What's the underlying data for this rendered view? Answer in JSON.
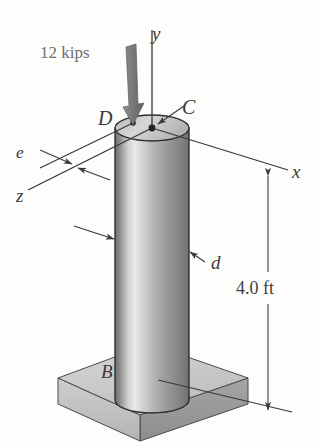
{
  "figure": {
    "kind": "engineering-diagram",
    "background_color": "#fdfdfc",
    "ink_color": "#3a3a3a"
  },
  "labels": {
    "load": "12 kips",
    "axis_y": "y",
    "axis_x": "x",
    "axis_z": "z",
    "eccentricity": "e",
    "diameter": "d",
    "point_c": "C",
    "point_d": "D",
    "point_b": "B",
    "height": "4.0 ft"
  },
  "colors": {
    "cylinder_dark": "#6b6b6b",
    "cylinder_highlight": "#e8e8e8",
    "cylinder_mid": "#a8a8a8",
    "base_top": "#cfcfcf",
    "base_front_left": "#c2c2c2",
    "base_front_right": "#9a9a9a",
    "top_face": "#c9c9c9",
    "arrow_gray": "#7c7c7c",
    "line": "#3a3a3a"
  },
  "geometry": {
    "cylinder": {
      "center_x": 152,
      "top_y": 128,
      "bottom_y": 400,
      "radius_x": 37,
      "radius_y": 13
    },
    "base_plate": {
      "top_left": [
        58,
        378
      ],
      "top_back": [
        150,
        344
      ],
      "top_right": [
        248,
        378
      ],
      "top_front": [
        140,
        415
      ],
      "thickness": 26
    },
    "axes": {
      "y_top": [
        152,
        30
      ],
      "y_origin": [
        152,
        128
      ],
      "x_end": [
        288,
        168
      ],
      "z_end": [
        28,
        192
      ]
    },
    "load_arrow": {
      "from": [
        130,
        48
      ],
      "to": [
        133,
        124
      ]
    },
    "dimension": {
      "x": 268,
      "top_y": 176,
      "bottom_y": 410
    }
  }
}
